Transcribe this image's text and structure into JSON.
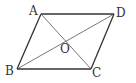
{
  "diagram": {
    "type": "parallelogram",
    "colors": {
      "stroke": "#333333",
      "background": "#ffffff"
    },
    "vertices": [
      {
        "name": "A",
        "x": 41,
        "y": 14,
        "label": "A",
        "lx": 29,
        "ly": 15
      },
      {
        "name": "D",
        "x": 114,
        "y": 14,
        "label": "D",
        "lx": 116,
        "ly": 17
      },
      {
        "name": "B",
        "x": 17,
        "y": 69,
        "label": "B",
        "lx": 5,
        "ly": 75
      },
      {
        "name": "C",
        "x": 91,
        "y": 69,
        "label": "C",
        "lx": 92,
        "ly": 77
      }
    ],
    "center": {
      "name": "O",
      "x": 65,
      "y": 41,
      "label": "O",
      "lx": 60,
      "ly": 53
    },
    "edges": [
      [
        "A",
        "D"
      ],
      [
        "D",
        "C"
      ],
      [
        "C",
        "B"
      ],
      [
        "B",
        "A"
      ]
    ],
    "diagonals": [
      [
        "A",
        "C"
      ],
      [
        "B",
        "D"
      ]
    ]
  }
}
